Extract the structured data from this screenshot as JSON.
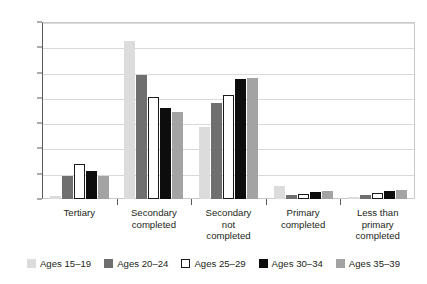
{
  "chart_data": {
    "type": "bar",
    "title": "",
    "xlabel": "",
    "ylabel": "",
    "ylim": [
      0,
      70
    ],
    "ytick_labels": [
      "0%",
      "10%",
      "20%",
      "30%",
      "40%",
      "50%",
      "60%",
      "70%"
    ],
    "ytick_values": [
      0,
      10,
      20,
      30,
      40,
      50,
      60,
      70
    ],
    "grid": true,
    "legend_position": "bottom",
    "categories": [
      "Tertiary",
      "Secondary completed",
      "Secondary not completed",
      "Primary completed",
      "Less than primary completed"
    ],
    "category_lines": [
      [
        "Tertiary"
      ],
      [
        "Secondary",
        "completed"
      ],
      [
        "Secondary",
        "not",
        "completed"
      ],
      [
        "Primary",
        "completed"
      ],
      [
        "Less than",
        "primary",
        "completed"
      ]
    ],
    "series": [
      {
        "name": "Ages 15-19",
        "color": "#dcdcdc",
        "values": [
          1.0,
          62.5,
          28.5,
          5.0,
          0.8
        ]
      },
      {
        "name": "Ages 20-24",
        "color": "#6f6f6f",
        "values": [
          9.0,
          49.0,
          38.0,
          1.5,
          1.5
        ]
      },
      {
        "name": "Ages 25-29",
        "color": "#ffffff",
        "values": [
          13.8,
          40.5,
          41.0,
          2.0,
          2.2
        ]
      },
      {
        "name": "Ages 30-34",
        "color": "#0d0d0d",
        "values": [
          11.0,
          36.0,
          47.5,
          2.8,
          3.3
        ]
      },
      {
        "name": "Ages 35-39",
        "color": "#a3a3a3",
        "values": [
          9.0,
          34.5,
          48.0,
          3.0,
          3.5
        ]
      }
    ]
  },
  "legend": {
    "items": [
      {
        "label": "Ages 15–19"
      },
      {
        "label": "Ages 20–24"
      },
      {
        "label": "Ages 25–29"
      },
      {
        "label": "Ages 30–34"
      },
      {
        "label": "Ages 35–39"
      }
    ]
  }
}
